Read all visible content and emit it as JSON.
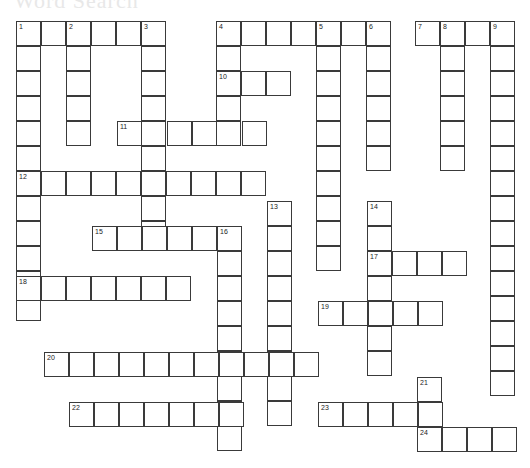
{
  "puzzle": {
    "title": "Word Search",
    "cell_size": 25,
    "line_color": "#3a3a3a",
    "entries": [
      {
        "number": "1",
        "dir": "across",
        "x": 16,
        "y": 21,
        "length": 6
      },
      {
        "number": "1",
        "dir": "down",
        "x": 16,
        "y": 21,
        "length": 12
      },
      {
        "number": "2",
        "dir": "down",
        "x": 66,
        "y": 21,
        "length": 5
      },
      {
        "number": "3",
        "dir": "down",
        "x": 141,
        "y": 21,
        "length": 9
      },
      {
        "number": "4",
        "dir": "across",
        "x": 216,
        "y": 21,
        "length": 7
      },
      {
        "number": "4",
        "dir": "down",
        "x": 216,
        "y": 21,
        "length": 5
      },
      {
        "number": "5",
        "dir": "down",
        "x": 316,
        "y": 21,
        "length": 10
      },
      {
        "number": "6",
        "dir": "down",
        "x": 366,
        "y": 21,
        "length": 6
      },
      {
        "number": "7",
        "dir": "across",
        "x": 415,
        "y": 21,
        "length": 4
      },
      {
        "number": "8",
        "dir": "down",
        "x": 440,
        "y": 21,
        "length": 6
      },
      {
        "number": "9",
        "dir": "down",
        "x": 490,
        "y": 21,
        "length": 15
      },
      {
        "number": "10",
        "dir": "across",
        "x": 216,
        "y": 71,
        "length": 3
      },
      {
        "number": "11",
        "dir": "across",
        "x": 117,
        "y": 121,
        "length": 6
      },
      {
        "number": "12",
        "dir": "across",
        "x": 16,
        "y": 171,
        "length": 10
      },
      {
        "number": "13",
        "dir": "down",
        "x": 267,
        "y": 201,
        "length": 9
      },
      {
        "number": "14",
        "dir": "down",
        "x": 367,
        "y": 201,
        "length": 7
      },
      {
        "number": "15",
        "dir": "across",
        "x": 92,
        "y": 226,
        "length": 6
      },
      {
        "number": "16",
        "dir": "down",
        "x": 217,
        "y": 226,
        "length": 9
      },
      {
        "number": "17",
        "dir": "across",
        "x": 367,
        "y": 251,
        "length": 4
      },
      {
        "number": "18",
        "dir": "across",
        "x": 16,
        "y": 276,
        "length": 7
      },
      {
        "number": "19",
        "dir": "across",
        "x": 318,
        "y": 301,
        "length": 5
      },
      {
        "number": "20",
        "dir": "across",
        "x": 44,
        "y": 352,
        "length": 11
      },
      {
        "number": "21",
        "dir": "down",
        "x": 417,
        "y": 377,
        "length": 2
      },
      {
        "number": "22",
        "dir": "across",
        "x": 69,
        "y": 402,
        "length": 7
      },
      {
        "number": "23",
        "dir": "across",
        "x": 318,
        "y": 402,
        "length": 5
      },
      {
        "number": "24",
        "dir": "across",
        "x": 417,
        "y": 427,
        "length": 4
      }
    ]
  }
}
